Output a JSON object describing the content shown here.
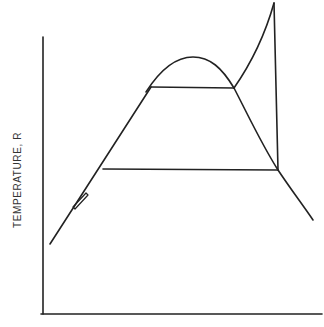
{
  "diagram": {
    "type": "temperature-entropy cycle diagram",
    "y_axis_label": "TEMPERATURE, R",
    "x_axis_label": "",
    "line_color": "#222222",
    "background": "#ffffff"
  }
}
